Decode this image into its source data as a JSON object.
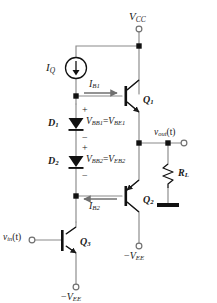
{
  "diagram": {
    "type": "circuit-schematic",
    "colors": {
      "wire": "#8a8a8a",
      "device": "#111111",
      "text": "#1a1a1a",
      "node": "#111111",
      "background": "#ffffff"
    }
  },
  "supplies": {
    "vcc": {
      "label": "V",
      "sub": "CC",
      "terminal": "open-circle"
    },
    "vee_q2": {
      "sign": "−",
      "label": "V",
      "sub": "EE",
      "terminal": "open-circle"
    },
    "vee_q3": {
      "sign": "−",
      "label": "V",
      "sub": "EE",
      "terminal": "open-circle"
    }
  },
  "sources": {
    "current_source": {
      "label": "I",
      "sub": "Q",
      "direction": "down"
    }
  },
  "currents": [
    {
      "name": "ib1",
      "label": "I",
      "sub": "B1",
      "direction": "right"
    },
    {
      "name": "ib2",
      "label": "I",
      "sub": "B2",
      "direction": "left"
    }
  ],
  "diodes": [
    {
      "ref": "D",
      "ref_sub": "1",
      "voltage": "V",
      "voltage_sub": "BB1",
      "equals": "=",
      "voltage2": "V",
      "voltage2_sub": "BE1",
      "plus": "+",
      "minus": "−"
    },
    {
      "ref": "D",
      "ref_sub": "2",
      "voltage": "V",
      "voltage_sub": "BB2",
      "equals": "=",
      "voltage2": "V",
      "voltage2_sub": "EB2",
      "plus": "+",
      "minus": "−"
    }
  ],
  "transistors": [
    {
      "ref": "Q",
      "sub": "1",
      "kind": "npn"
    },
    {
      "ref": "Q",
      "sub": "2",
      "kind": "pnp"
    },
    {
      "ref": "Q",
      "sub": "3",
      "kind": "npn"
    }
  ],
  "resistors": [
    {
      "ref": "R",
      "sub": "L"
    }
  ],
  "signals": {
    "input": {
      "label": "v",
      "sub": "in",
      "arg": "(t)",
      "terminal": "open-circle"
    },
    "output": {
      "label": "v",
      "sub": "out",
      "arg": "(t)",
      "terminal": "open-circle"
    }
  },
  "ground": {
    "name": "ground-symbol",
    "style": "thick-bar"
  }
}
